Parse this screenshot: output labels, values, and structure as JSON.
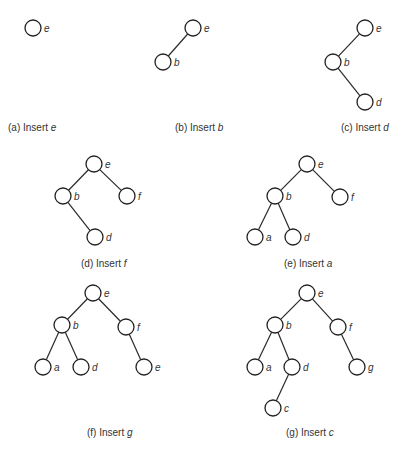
{
  "figure": {
    "background": "#ffffff",
    "line_color": "#2a2a2a",
    "node_radius": 8,
    "panels": [
      {
        "id": "a",
        "caption_prefix": "(a) Insert ",
        "caption_var": "e",
        "caption_pos": [
          8,
          122
        ],
        "nodes": [
          {
            "id": "e",
            "label": "e",
            "x": 33,
            "y": 28
          }
        ],
        "edges": []
      },
      {
        "id": "b",
        "caption_prefix": "(b) Insert ",
        "caption_var": "b",
        "caption_pos": [
          175,
          122
        ],
        "nodes": [
          {
            "id": "e",
            "label": "e",
            "x": 193,
            "y": 28
          },
          {
            "id": "b",
            "label": "b",
            "x": 163,
            "y": 62
          }
        ],
        "edges": [
          [
            "e",
            "b"
          ]
        ]
      },
      {
        "id": "c",
        "caption_prefix": "(c) Insert ",
        "caption_var": "d",
        "caption_pos": [
          341,
          122
        ],
        "nodes": [
          {
            "id": "e",
            "label": "e",
            "x": 365,
            "y": 28
          },
          {
            "id": "b",
            "label": "b",
            "x": 333,
            "y": 62
          },
          {
            "id": "d",
            "label": "d",
            "x": 365,
            "y": 102
          }
        ],
        "edges": [
          [
            "e",
            "b"
          ],
          [
            "b",
            "d"
          ]
        ]
      },
      {
        "id": "d",
        "caption_prefix": "(d) Insert ",
        "caption_var": "f",
        "caption_pos": [
          81,
          258
        ],
        "nodes": [
          {
            "id": "e",
            "label": "e",
            "x": 94,
            "y": 164
          },
          {
            "id": "b",
            "label": "b",
            "x": 63,
            "y": 196
          },
          {
            "id": "f",
            "label": "f",
            "x": 127,
            "y": 196
          },
          {
            "id": "d",
            "label": "d",
            "x": 95,
            "y": 237
          }
        ],
        "edges": [
          [
            "e",
            "b"
          ],
          [
            "e",
            "f"
          ],
          [
            "b",
            "d"
          ]
        ]
      },
      {
        "id": "e",
        "caption_prefix": "(e) Insert ",
        "caption_var": "a",
        "caption_pos": [
          284,
          258
        ],
        "nodes": [
          {
            "id": "e",
            "label": "e",
            "x": 307,
            "y": 164
          },
          {
            "id": "b",
            "label": "b",
            "x": 275,
            "y": 196
          },
          {
            "id": "f",
            "label": "f",
            "x": 340,
            "y": 197
          },
          {
            "id": "a",
            "label": "a",
            "x": 255,
            "y": 237
          },
          {
            "id": "d",
            "label": "d",
            "x": 293,
            "y": 237
          }
        ],
        "edges": [
          [
            "e",
            "b"
          ],
          [
            "e",
            "f"
          ],
          [
            "b",
            "a"
          ],
          [
            "b",
            "d"
          ]
        ]
      },
      {
        "id": "f",
        "caption_prefix": "(f) Insert ",
        "caption_var": "g",
        "caption_pos": [
          87,
          427
        ],
        "nodes": [
          {
            "id": "e",
            "label": "e",
            "x": 93,
            "y": 293
          },
          {
            "id": "b",
            "label": "b",
            "x": 62,
            "y": 325
          },
          {
            "id": "f",
            "label": "f",
            "x": 126,
            "y": 327
          },
          {
            "id": "a",
            "label": "a",
            "x": 43,
            "y": 367
          },
          {
            "id": "d",
            "label": "d",
            "x": 81,
            "y": 367
          },
          {
            "id": "g",
            "label": "e",
            "x": 144,
            "y": 367
          }
        ],
        "edges": [
          [
            "e",
            "b"
          ],
          [
            "e",
            "f"
          ],
          [
            "b",
            "a"
          ],
          [
            "b",
            "d"
          ],
          [
            "f",
            "g"
          ]
        ]
      },
      {
        "id": "g",
        "caption_prefix": "(g) Insert ",
        "caption_var": "c",
        "caption_pos": [
          286,
          427
        ],
        "nodes": [
          {
            "id": "e",
            "label": "e",
            "x": 307,
            "y": 293
          },
          {
            "id": "b",
            "label": "b",
            "x": 275,
            "y": 325
          },
          {
            "id": "f",
            "label": "f",
            "x": 338,
            "y": 327
          },
          {
            "id": "a",
            "label": "a",
            "x": 255,
            "y": 367
          },
          {
            "id": "d",
            "label": "d",
            "x": 292,
            "y": 367
          },
          {
            "id": "g",
            "label": "g",
            "x": 357,
            "y": 367
          },
          {
            "id": "c",
            "label": "c",
            "x": 273,
            "y": 408
          }
        ],
        "edges": [
          [
            "e",
            "b"
          ],
          [
            "e",
            "f"
          ],
          [
            "b",
            "a"
          ],
          [
            "b",
            "d"
          ],
          [
            "f",
            "g"
          ],
          [
            "d",
            "c"
          ]
        ]
      }
    ]
  }
}
